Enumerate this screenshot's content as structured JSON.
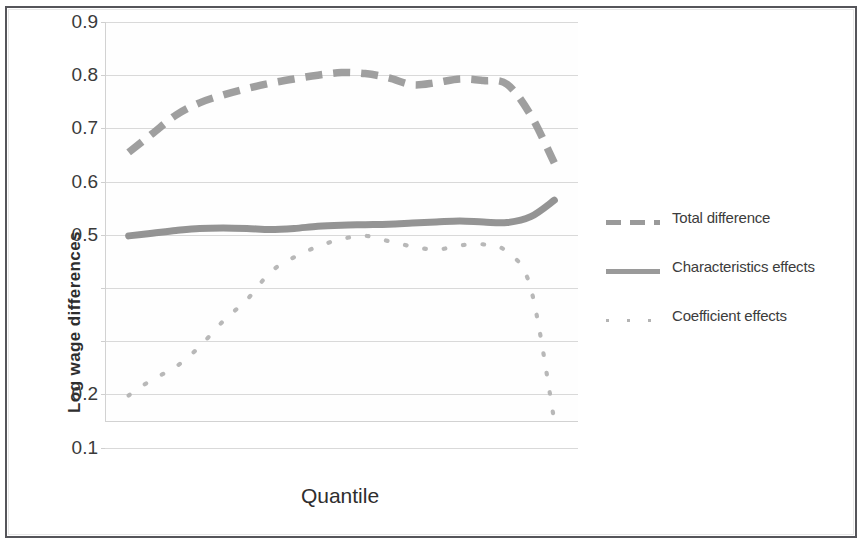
{
  "chart_data": {
    "type": "line",
    "title": "",
    "subtitle": "",
    "xlabel": "Quantile",
    "ylabel": "Log wage differences",
    "ylim": [
      0.05,
      0.9
    ],
    "xlim": [
      0,
      1
    ],
    "grid": true,
    "legend_position": "right",
    "ytick_labels": [
      "0.9",
      "0.8",
      "0.7",
      "0.6",
      "0.5",
      "0.2",
      "0.1"
    ],
    "ytick_values": [
      0.9,
      0.8,
      0.7,
      0.6,
      0.5,
      0.2,
      0.1
    ],
    "gridline_values": [
      0.9,
      0.8,
      0.7,
      0.6,
      0.5,
      0.4,
      0.3,
      0.2,
      0.1
    ],
    "xtick_labels": [],
    "x": [
      0.05,
      0.1,
      0.15,
      0.2,
      0.25,
      0.3,
      0.35,
      0.4,
      0.45,
      0.5,
      0.55,
      0.6,
      0.65,
      0.7,
      0.75,
      0.8,
      0.85,
      0.9,
      0.95
    ],
    "series": [
      {
        "name": "Total difference",
        "style": "dashed",
        "color": "#9a9a9a",
        "values": [
          0.655,
          0.69,
          0.725,
          0.748,
          0.763,
          0.775,
          0.785,
          0.793,
          0.8,
          0.805,
          0.803,
          0.795,
          0.782,
          0.786,
          0.793,
          0.79,
          0.783,
          0.725,
          0.635
        ]
      },
      {
        "name": "Characteristics effects",
        "style": "solid",
        "color": "#8e8e8e",
        "values": [
          0.498,
          0.503,
          0.508,
          0.512,
          0.513,
          0.512,
          0.51,
          0.512,
          0.516,
          0.518,
          0.519,
          0.52,
          0.522,
          0.524,
          0.526,
          0.524,
          0.523,
          0.534,
          0.565
        ]
      },
      {
        "name": "Coefficient effects",
        "style": "dotted",
        "color": "#b4b4b4",
        "values": [
          0.198,
          0.228,
          0.252,
          0.29,
          0.338,
          0.378,
          0.43,
          0.458,
          0.478,
          0.492,
          0.498,
          0.488,
          0.478,
          0.472,
          0.48,
          0.482,
          0.468,
          0.4,
          0.15
        ]
      }
    ]
  },
  "legend": {
    "items": [
      {
        "label": "Total difference",
        "style": "dashed"
      },
      {
        "label": "Characteristics effects",
        "style": "solid"
      },
      {
        "label": "Coefficient effects",
        "style": "dotted"
      }
    ]
  },
  "axes": {
    "x_title": "Quantile",
    "y_title": "Log wage differences"
  }
}
